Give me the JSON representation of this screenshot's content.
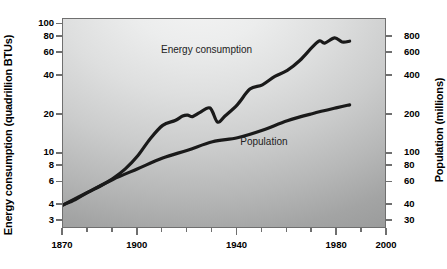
{
  "chart_data": {
    "type": "line",
    "title": "",
    "xlabel": "",
    "ylabel": "Energy consumption (quadrillion BTUs)",
    "y2label": "Population (millions)",
    "xscale": "linear",
    "yscale": "log",
    "y2scale": "log",
    "xlim": [
      1870,
      2000
    ],
    "ylim": [
      2.6,
      110
    ],
    "y2lim": [
      26,
      1100
    ],
    "grid": false,
    "legend_position": "inline-labels",
    "xticks": [
      1870,
      1900,
      1940,
      1980,
      2000
    ],
    "xtick_labels": [
      "1870",
      "1900",
      "1940",
      "1980",
      "2000"
    ],
    "xminor_ticks": [
      1880,
      1890,
      1910,
      1920,
      1930,
      1950,
      1960,
      1970,
      1990
    ],
    "yticks": [
      3,
      4,
      6,
      8,
      10,
      20,
      40,
      60,
      80,
      100
    ],
    "ytick_labels": [
      "3",
      "4",
      "6",
      "8",
      "10",
      "20",
      "40",
      "60",
      "80",
      "100"
    ],
    "y2ticks": [
      30,
      40,
      60,
      80,
      100,
      200,
      400,
      600,
      800
    ],
    "y2tick_labels": [
      "30",
      "40",
      "60",
      "80",
      "100",
      "200",
      "400",
      "600",
      "800"
    ],
    "series": [
      {
        "name": "Energy consumption",
        "axis": "left",
        "units": "quadrillion BTUs",
        "label_x": 1928,
        "label_y": 62,
        "x": [
          1870,
          1875,
          1880,
          1885,
          1890,
          1895,
          1900,
          1905,
          1910,
          1915,
          1918,
          1920,
          1922,
          1925,
          1929,
          1932,
          1935,
          1940,
          1945,
          1950,
          1955,
          1960,
          1965,
          1970,
          1973,
          1975,
          1979,
          1982,
          1985
        ],
        "y": [
          4.0,
          4.4,
          5.0,
          5.6,
          6.4,
          7.6,
          9.6,
          13.0,
          16.5,
          18.0,
          19.5,
          19.8,
          19.3,
          20.8,
          22.5,
          17.5,
          19.5,
          23.9,
          31.5,
          34.0,
          39.5,
          44.0,
          52.5,
          66.5,
          74.5,
          71.5,
          78.5,
          73.0,
          74.0
        ]
      },
      {
        "name": "Population",
        "axis": "right",
        "units": "millions",
        "label_x": 1951,
        "label_y": 120,
        "x": [
          1870,
          1880,
          1890,
          1900,
          1910,
          1920,
          1930,
          1940,
          1950,
          1960,
          1970,
          1980,
          1985
        ],
        "y": [
          39.8,
          50.2,
          62.9,
          76.2,
          92.2,
          106.0,
          123.2,
          132.2,
          151.3,
          179.3,
          203.3,
          226.5,
          237.9
        ]
      }
    ]
  },
  "labels": {
    "energy_label": "Energy consumption",
    "population_label": "Population",
    "ylabel_left": "Energy consumption (quadrillion BTUs)",
    "ylabel_right": "Population (millions)"
  },
  "colors": {
    "line": "#1a1a1a",
    "axis": "#6f6f6f",
    "text": "#000000",
    "bg_light": "#f4f4f4",
    "bg_dark": "#979898"
  }
}
